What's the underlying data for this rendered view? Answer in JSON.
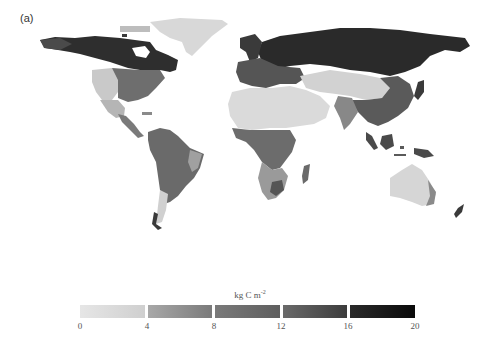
{
  "figure": {
    "panel_label": "(a)",
    "map_type": "global gridded carbon density (grayscale)"
  },
  "colorbar": {
    "title": "kg C m",
    "title_superscript": "-2",
    "ticks": [
      "0",
      "4",
      "8",
      "12",
      "16",
      "20"
    ],
    "range": [
      0,
      20
    ],
    "segments": [
      {
        "from": 0,
        "to": 4,
        "color_start": "#e6e6e6",
        "color_end": "#cfcfcf"
      },
      {
        "from": 4,
        "to": 8,
        "color_start": "#a8a8a8",
        "color_end": "#7a7a7a"
      },
      {
        "from": 8,
        "to": 12,
        "color_start": "#7a7a7a",
        "color_end": "#5e5e5e"
      },
      {
        "from": 12,
        "to": 16,
        "color_start": "#6a6a6a",
        "color_end": "#3c3c3c"
      },
      {
        "from": 16,
        "to": 20,
        "color_start": "#2a2a2a",
        "color_end": "#0a0a0a"
      }
    ]
  },
  "regions": [
    {
      "name": "Greenland",
      "shade": "#d8d8d8"
    },
    {
      "name": "Boreal North America",
      "shade": "#2e2e2e"
    },
    {
      "name": "Western USA",
      "shade": "#c9c9c9"
    },
    {
      "name": "Eastern USA",
      "shade": "#6e6e6e"
    },
    {
      "name": "Central America",
      "shade": "#7a7a7a"
    },
    {
      "name": "South America",
      "shade": "#6a6a6a"
    },
    {
      "name": "Patagonia",
      "shade": "#d0d0d0"
    },
    {
      "name": "Siberia / Boreal Eurasia",
      "shade": "#2a2a2a"
    },
    {
      "name": "Europe",
      "shade": "#555555"
    },
    {
      "name": "Sahara / Arabia",
      "shade": "#dadada"
    },
    {
      "name": "Central Asia",
      "shade": "#d2d2d2"
    },
    {
      "name": "East / Southeast Asia",
      "shade": "#5a5a5a"
    },
    {
      "name": "Central Africa",
      "shade": "#6c6c6c"
    },
    {
      "name": "Southern Africa",
      "shade": "#9a9a9a"
    },
    {
      "name": "Madagascar",
      "shade": "#6a6a6a"
    },
    {
      "name": "Indonesia",
      "shade": "#4a4a4a"
    },
    {
      "name": "Australia",
      "shade": "#d6d6d6"
    },
    {
      "name": "New Zealand",
      "shade": "#3a3a3a"
    }
  ]
}
